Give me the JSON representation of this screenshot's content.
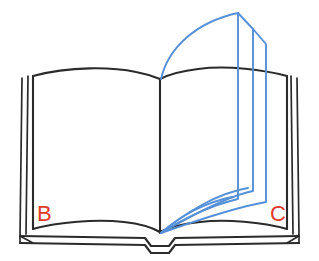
{
  "figure": {
    "kind": "line-drawing",
    "background_color": "#ffffff"
  },
  "labels": {
    "left_page": "B",
    "right_page": "C",
    "color": "#e03a2a"
  },
  "colors": {
    "ink": "#2b2b2b",
    "page_turn": "#5590d8",
    "label_red": "#e03a2a",
    "paper": "#ffffff"
  },
  "parts": {
    "left_page_name": "left-page",
    "right_page_name": "right-page",
    "spine_name": "book-spine",
    "cover_name": "book-cover",
    "turning_pages_name": "turning-pages",
    "turning_page_count": 3
  }
}
